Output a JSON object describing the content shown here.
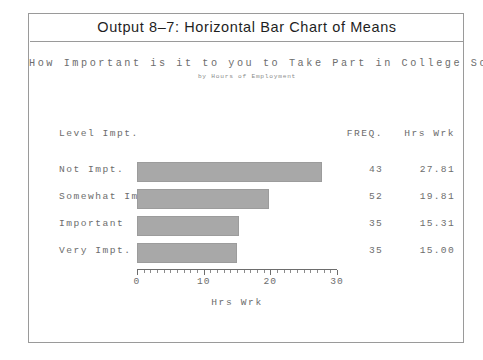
{
  "frame": {
    "title": "Output 8–7: Horizontal Bar Chart of Means",
    "main_question": "How Important is it to you to Take Part in College Social Life?",
    "sub_heading": "by Hours of Employment"
  },
  "columns": {
    "category_header": "Level Impt.",
    "freq_header": "FREQ.",
    "mean_header": "Hrs Wrk"
  },
  "chart_data": {
    "type": "bar",
    "orientation": "horizontal",
    "title": "Output 8–7: Horizontal Bar Chart of Means",
    "subtitle": "How Important is it to you to Take Part in College Social Life?",
    "annotation": "by Hours of Employment",
    "categories": [
      "Not Impt.",
      "Somewhat Impt.",
      "Important",
      "Very Impt."
    ],
    "values": [
      27.81,
      19.81,
      15.31,
      15.0
    ],
    "freq": [
      43,
      52,
      35,
      35
    ],
    "value_labels": [
      "27.81",
      "19.81",
      "15.31",
      "15.00"
    ],
    "freq_labels": [
      "43",
      "52",
      "35",
      "35"
    ],
    "xlabel": "Hrs Wrk",
    "ylabel": "Level Impt.",
    "xlim": [
      0,
      30
    ],
    "xticks": [
      0,
      10,
      20,
      30
    ],
    "xtick_labels": [
      "0",
      "10",
      "20",
      "30"
    ],
    "minor_tick_step": 1,
    "grid": false,
    "legend": false,
    "bar_color": "#a8a8a8",
    "axis_color": "#6d6d6d"
  }
}
